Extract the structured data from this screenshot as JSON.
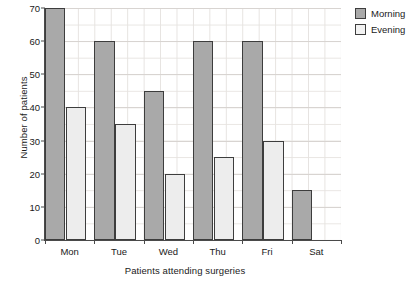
{
  "chart_data": {
    "type": "bar",
    "title": "",
    "xlabel": "Patients attending surgeries",
    "ylabel": "Number of patients",
    "categories": [
      "Mon",
      "Tue",
      "Wed",
      "Thu",
      "Fri",
      "Sat"
    ],
    "series": [
      {
        "name": "Morning",
        "color": "#a9a9a9",
        "values": [
          70,
          60,
          45,
          60,
          60,
          15
        ]
      },
      {
        "name": "Evening",
        "color": "#ededed",
        "values": [
          40,
          35,
          20,
          25,
          30,
          null
        ]
      }
    ],
    "ylim": [
      0,
      70
    ],
    "ytick_labels": [
      "0",
      "10",
      "20",
      "30",
      "40",
      "50",
      "60",
      "70"
    ],
    "ytick_values": [
      0,
      10,
      20,
      30,
      40,
      50,
      60,
      70
    ],
    "grid": true,
    "legend_position": "top-right"
  },
  "legend": {
    "items": [
      {
        "label": "Morning",
        "swatch": "morning"
      },
      {
        "label": "Evening",
        "swatch": "evening"
      }
    ]
  }
}
